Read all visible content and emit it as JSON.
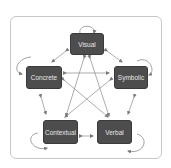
{
  "diagram": {
    "type": "concept-network",
    "nodes": [
      {
        "id": "visual",
        "label": "Visual"
      },
      {
        "id": "concrete",
        "label": "Concrete"
      },
      {
        "id": "symbolic",
        "label": "Symbolic"
      },
      {
        "id": "contextual",
        "label": "Contextual"
      },
      {
        "id": "verbal",
        "label": "Verbal"
      }
    ],
    "edges": [
      {
        "from": "visual",
        "to": "visual",
        "kind": "self-loop"
      },
      {
        "from": "concrete",
        "to": "concrete",
        "kind": "self-loop"
      },
      {
        "from": "symbolic",
        "to": "symbolic",
        "kind": "self-loop"
      },
      {
        "from": "contextual",
        "to": "contextual",
        "kind": "self-loop"
      },
      {
        "from": "verbal",
        "to": "verbal",
        "kind": "self-loop"
      },
      {
        "from": "visual",
        "to": "concrete",
        "kind": "bidirectional"
      },
      {
        "from": "visual",
        "to": "symbolic",
        "kind": "bidirectional"
      },
      {
        "from": "visual",
        "to": "contextual",
        "kind": "bidirectional"
      },
      {
        "from": "visual",
        "to": "verbal",
        "kind": "bidirectional"
      },
      {
        "from": "concrete",
        "to": "symbolic",
        "kind": "bidirectional"
      },
      {
        "from": "concrete",
        "to": "contextual",
        "kind": "bidirectional"
      },
      {
        "from": "concrete",
        "to": "verbal",
        "kind": "bidirectional"
      },
      {
        "from": "symbolic",
        "to": "contextual",
        "kind": "bidirectional"
      },
      {
        "from": "symbolic",
        "to": "verbal",
        "kind": "bidirectional"
      },
      {
        "from": "contextual",
        "to": "verbal",
        "kind": "bidirectional"
      }
    ],
    "colors": {
      "node_fill": "#4d4d4d",
      "node_text": "#e6e6e6",
      "edge": "#8a8a8a",
      "frame_border": "#c8c8c8"
    }
  }
}
